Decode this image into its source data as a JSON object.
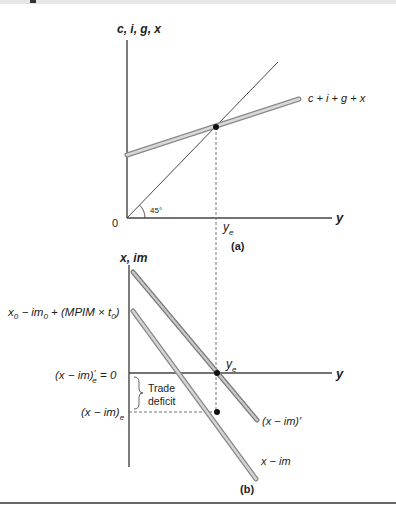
{
  "panel_a": {
    "y_axis_label": "c, i, g, x",
    "x_axis_label": "y",
    "origin_label": "0",
    "angle_label": "45°",
    "curve_label": "c + i + g + x",
    "equilibrium_label_main": "y",
    "equilibrium_label_sub": "e",
    "panel_caption": "(a)"
  },
  "panel_b": {
    "y_axis_label": "x, im",
    "x_axis_label": "y",
    "intercept_label": {
      "p1": "x",
      "s1": "0",
      "p2": " − im",
      "s2": "0",
      "p3": " + (MPIM × t",
      "s3": "0",
      "p4": ")"
    },
    "zero_label": {
      "main": "(x − im)",
      "prime": "′",
      "sub": "e",
      "tail": " = 0"
    },
    "deficit_level_label": {
      "main": "(x − im)",
      "sub": "e"
    },
    "trade_deficit_label": [
      "Trade",
      "deficit"
    ],
    "equilibrium_label_main": "y",
    "equilibrium_label_sub": "e",
    "shifted_curve_label": "(x − im)′",
    "curve_label": "x − im",
    "panel_caption": "(b)"
  },
  "colors": {
    "axis": "#444444",
    "thick_line_fill": "#bdbdbd",
    "thick_line_edge": "#8a8a8a",
    "dot": "#111111",
    "dash": "#666666"
  }
}
